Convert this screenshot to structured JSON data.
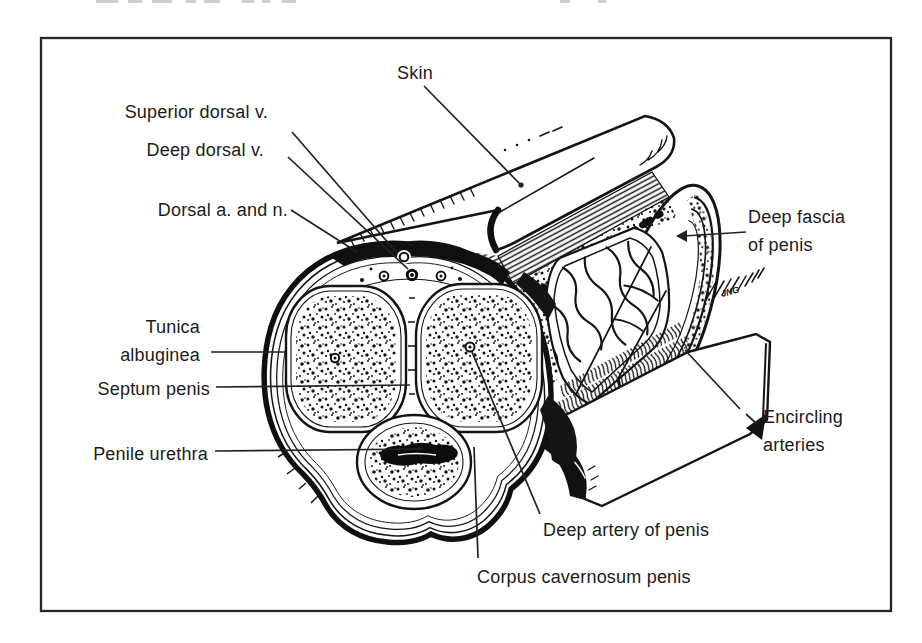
{
  "figure": {
    "type": "anatomical line illustration",
    "signature": "JNG",
    "ink_color": "#1a1a1a",
    "paper_color": "#ffffff"
  },
  "labels": {
    "skin": {
      "text": "Skin"
    },
    "superior_dorsal_vein": {
      "text": "Superior dorsal v."
    },
    "deep_dorsal_vein": {
      "text": "Deep dorsal v."
    },
    "dorsal_artery_nerve": {
      "text": "Dorsal a. and n."
    },
    "deep_fascia": {
      "lines": [
        "Deep fascia",
        "of penis"
      ]
    },
    "tunica_albuginea": {
      "lines": [
        "Tunica",
        "albuginea"
      ]
    },
    "septum_penis": {
      "text": "Septum penis"
    },
    "penile_urethra": {
      "text": "Penile urethra"
    },
    "encircling_arteries": {
      "lines": [
        "Encircling",
        "arteries"
      ]
    },
    "deep_artery": {
      "text": "Deep artery of penis"
    },
    "corpus_cavernosum": {
      "text": "Corpus cavernosum penis"
    }
  }
}
